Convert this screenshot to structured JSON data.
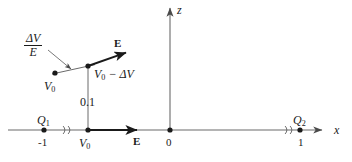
{
  "figure": {
    "type": "physics-field-diagram",
    "background_color": "#ffffff",
    "line_color": "#4a4a4a",
    "text_color": "#1a1a1a"
  },
  "axes": {
    "x_axis": {
      "label": "x",
      "label_x": 336,
      "label_y": 130,
      "line_y": 130,
      "x_start": 8,
      "x_end": 322,
      "arrow": true
    },
    "z_axis": {
      "label": "z",
      "label_x": 178,
      "label_y": 10,
      "line_x": 170,
      "y_start": 130,
      "y_end": 6,
      "arrow": true
    },
    "origin": {
      "label": "0",
      "x": 170,
      "y": 130
    },
    "break_marks": [
      {
        "name": "break-left",
        "x": 66,
        "y": 130
      },
      {
        "name": "break-right",
        "x": 288,
        "y": 130
      }
    ]
  },
  "charges": [
    {
      "name": "charge-q1",
      "label": "Q",
      "subscript": "1",
      "tick_label": "-1",
      "x": 44,
      "y": 130,
      "label_x": 38,
      "label_y": 117,
      "tick_x": 44,
      "tick_y": 137
    },
    {
      "name": "charge-q2",
      "label": "Q",
      "subscript": "2",
      "tick_label": "1",
      "x": 300,
      "y": 130,
      "label_x": 294,
      "label_y": 117,
      "tick_x": 300,
      "tick_y": 137
    }
  ],
  "field_points": [
    {
      "name": "point-v0-axis",
      "label": "V",
      "subscript": "0",
      "x": 88,
      "y": 130,
      "label_x": 80,
      "label_y": 137
    },
    {
      "name": "point-v0-upper-left",
      "label": "V",
      "subscript": "0",
      "x": 55,
      "y": 73,
      "label_x": 46,
      "label_y": 80
    },
    {
      "name": "point-v0-minus-dv",
      "label": "V",
      "subscript": "0",
      "suffix": " − ΔV",
      "x": 88,
      "y": 66,
      "label_x": 94,
      "label_y": 68
    }
  ],
  "vectors": [
    {
      "name": "e-vector-upper",
      "label": "E",
      "x1": 88,
      "y1": 66,
      "x2": 131,
      "y2": 51,
      "label_x": 114,
      "label_y": 38
    },
    {
      "name": "e-vector-axis",
      "label": "E",
      "x1": 88,
      "y1": 130,
      "x2": 142,
      "y2": 130,
      "label_x": 133,
      "label_y": 137
    }
  ],
  "equipotential_line": {
    "name": "equipotential-segment",
    "x1": 55,
    "y1": 73,
    "x2": 92,
    "y2": 65
  },
  "annotations": [
    {
      "name": "delta-v-over-e-annotation",
      "numerator": "ΔV",
      "denominator": "E",
      "label_x": 24,
      "label_y": 32,
      "leader_x1": 50,
      "leader_y1": 52,
      "leader_x2": 72,
      "leader_y2": 70
    },
    {
      "name": "spacing-annotation",
      "text": "0.1",
      "label_x": 80,
      "label_y": 96,
      "line_x": 88,
      "line_y1": 66,
      "line_y2": 130
    }
  ]
}
